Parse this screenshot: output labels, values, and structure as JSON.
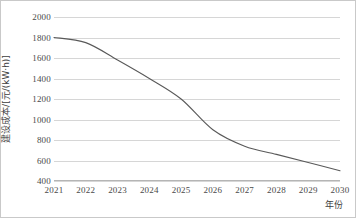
{
  "chart_data": {
    "type": "line",
    "title": "",
    "xlabel": "年份",
    "ylabel": "建设成本/[元/(kW·h)]",
    "categories": [
      "2021",
      "2022",
      "2023",
      "2024",
      "2025",
      "2026",
      "2027",
      "2028",
      "2029",
      "2030"
    ],
    "values": [
      1800,
      1750,
      1580,
      1400,
      1200,
      900,
      740,
      660,
      580,
      500
    ],
    "series": [
      {
        "name": "建设成本",
        "values": [
          1800,
          1750,
          1580,
          1400,
          1200,
          900,
          740,
          660,
          580,
          500
        ]
      }
    ],
    "ylim": [
      400,
      2000
    ],
    "ytick_step": 200,
    "yticks": [
      "2000",
      "1800",
      "1600",
      "1400",
      "1200",
      "1000",
      "800",
      "600",
      "400"
    ],
    "ytick_values": [
      2000,
      1800,
      1600,
      1400,
      1200,
      1000,
      800,
      600,
      400
    ],
    "grid": true,
    "grid_axis": "y",
    "legend": "none",
    "line_color": "#595959",
    "grid_color": "#d6d6d6",
    "axis_color": "#b5b5b5",
    "text_color": "#4a4a4a",
    "background": "#ffffff"
  }
}
